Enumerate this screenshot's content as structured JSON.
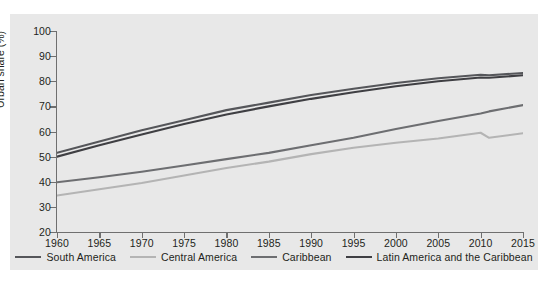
{
  "chart_data": {
    "type": "line",
    "title": "",
    "xlabel": "",
    "ylabel": "Urban share (%)",
    "xlim": [
      1960,
      2015
    ],
    "ylim": [
      20,
      100
    ],
    "xticks": [
      1960,
      1965,
      1970,
      1975,
      1980,
      1985,
      1990,
      1995,
      2000,
      2005,
      2010,
      2015
    ],
    "yticks": [
      20,
      30,
      40,
      50,
      60,
      70,
      80,
      90,
      100
    ],
    "grid": false,
    "legend_position": "bottom",
    "x": [
      1960,
      1965,
      1970,
      1975,
      1980,
      1985,
      1990,
      1995,
      2000,
      2005,
      2010,
      2011,
      2015
    ],
    "series": [
      {
        "name": "South America",
        "color": "#55565a",
        "values": [
          51.5,
          56.0,
          60.5,
          64.5,
          68.5,
          71.5,
          74.5,
          77.0,
          79.3,
          81.2,
          82.6,
          82.4,
          83.3
        ]
      },
      {
        "name": "Central America",
        "color": "#b4b4b4",
        "values": [
          34.5,
          37.0,
          39.5,
          42.5,
          45.5,
          48.0,
          51.0,
          53.5,
          55.5,
          57.2,
          59.5,
          57.5,
          59.3
        ]
      },
      {
        "name": "Caribbean",
        "color": "#6d6e71",
        "values": [
          39.8,
          41.8,
          44.0,
          46.5,
          49.0,
          51.5,
          54.5,
          57.5,
          61.0,
          64.2,
          67.2,
          68.0,
          70.5
        ]
      },
      {
        "name": "Latin America and the Caribbean",
        "color": "#3f3f43",
        "values": [
          50.0,
          54.5,
          58.8,
          63.0,
          66.8,
          70.0,
          73.0,
          75.6,
          78.0,
          80.0,
          81.5,
          81.4,
          82.4
        ]
      }
    ]
  },
  "legend": {
    "items": [
      {
        "label": "South America",
        "color": "#55565a"
      },
      {
        "label": "Central America",
        "color": "#b4b4b4"
      },
      {
        "label": "Caribbean",
        "color": "#6d6e71"
      },
      {
        "label": "Latin America and the Caribbean",
        "color": "#3f3f43"
      }
    ]
  },
  "axes": {
    "y_title": "Urban share (%)"
  }
}
